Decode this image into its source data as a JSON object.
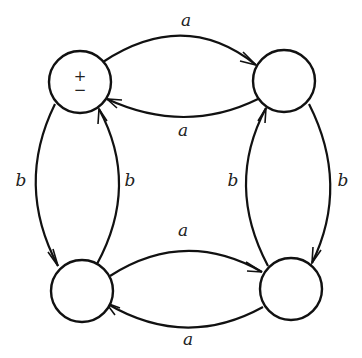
{
  "diagram": {
    "type": "state-transition-graph",
    "nodes": [
      {
        "id": "top-left",
        "cx": 80,
        "cy": 82,
        "r": 31,
        "label_top": "+",
        "label_bottom": "−"
      },
      {
        "id": "top-right",
        "cx": 284,
        "cy": 81,
        "r": 31,
        "label_top": "",
        "label_bottom": ""
      },
      {
        "id": "bottom-left",
        "cx": 82,
        "cy": 291,
        "r": 31,
        "label_top": "",
        "label_bottom": ""
      },
      {
        "id": "bottom-right",
        "cx": 291,
        "cy": 289,
        "r": 31,
        "label_top": "",
        "label_bottom": ""
      }
    ],
    "edges": [
      {
        "from": "top-left",
        "to": "top-right",
        "label": "a"
      },
      {
        "from": "top-right",
        "to": "top-left",
        "label": "a"
      },
      {
        "from": "bottom-left",
        "to": "bottom-right",
        "label": "a"
      },
      {
        "from": "bottom-right",
        "to": "bottom-left",
        "label": "a"
      },
      {
        "from": "top-left",
        "to": "bottom-left",
        "label": "b"
      },
      {
        "from": "bottom-left",
        "to": "top-left",
        "label": "b"
      },
      {
        "from": "top-right",
        "to": "bottom-right",
        "label": "b"
      },
      {
        "from": "bottom-right",
        "to": "top-right",
        "label": "b"
      }
    ]
  },
  "labels": {
    "top_arc_a": "a",
    "upper_return_a": "a",
    "lower_arc_a": "a",
    "bottom_return_a": "a",
    "left_outer_b": "b",
    "left_inner_b": "b",
    "right_inner_b": "b",
    "right_outer_b": "b",
    "start_plus": "+",
    "start_minus": "−"
  }
}
